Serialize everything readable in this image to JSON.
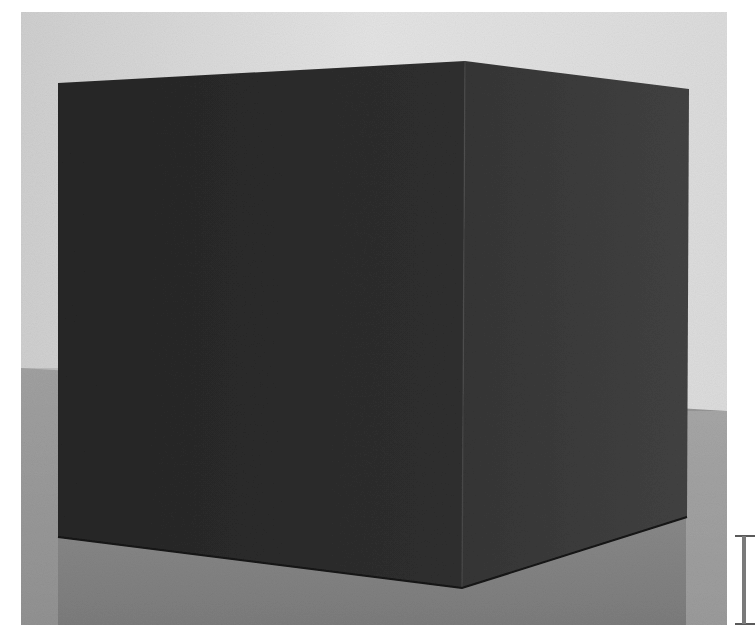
{
  "image": {
    "subject": "dark cube sculpture on floor against white wall",
    "colors": {
      "page_bg": "#ffffff",
      "wall": "#e2e2e2",
      "wall_shadow": "#cfcfcf",
      "floor": "#8a8a8a",
      "floor_light": "#a4a4a4",
      "cube_left_face": "#2c2c2c",
      "cube_right_face": "#3d3d3d",
      "cube_edge": "#1e1e1e",
      "cursor": "#6a6a6a"
    }
  },
  "cursor": {
    "icon": "text-cursor-ibeam-icon"
  }
}
